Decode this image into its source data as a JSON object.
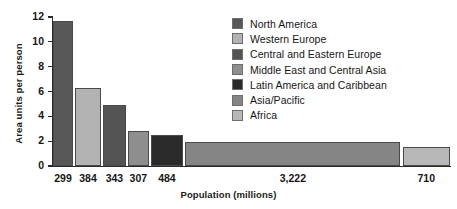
{
  "chart_data": {
    "type": "bar",
    "title": "",
    "subtitle": "",
    "xlabel": "Population (millions)",
    "ylabel": "Area units per person",
    "ylim": [
      0,
      12
    ],
    "yticks": [
      0,
      2,
      4,
      6,
      8,
      10,
      12
    ],
    "ytick_labels": [
      "0",
      "2",
      "4",
      "6",
      "8",
      "10",
      "12"
    ],
    "grid": false,
    "legend_position": "top-right",
    "variable_width": true,
    "width_meaning": "Population (millions)",
    "categories": [
      "North America",
      "Western Europe",
      "Central and Eastern Europe",
      "Middle East and Central Asia",
      "Latin America and Caribbean",
      "Asia/Pacific",
      "Africa"
    ],
    "xtick_labels": [
      "299",
      "384",
      "343",
      "307",
      "484",
      "3,222",
      "710"
    ],
    "widths": [
      299,
      384,
      343,
      307,
      484,
      3222,
      710
    ],
    "values": [
      11.7,
      6.3,
      4.9,
      2.8,
      2.5,
      1.95,
      1.55
    ],
    "colors": [
      "#585858",
      "#b3b3b3",
      "#545454",
      "#8e8e8e",
      "#2a2a2a",
      "#858585",
      "#b8b8b8"
    ],
    "series": [
      {
        "name": "Area units per person",
        "values": [
          11.7,
          6.3,
          4.9,
          2.8,
          2.5,
          1.95,
          1.55
        ]
      }
    ]
  },
  "legend": {
    "items": [
      {
        "label": "North America",
        "color": "#585858"
      },
      {
        "label": "Western Europe",
        "color": "#b3b3b3"
      },
      {
        "label": "Central and Eastern Europe",
        "color": "#545454"
      },
      {
        "label": "Middle East and Central Asia",
        "color": "#8e8e8e"
      },
      {
        "label": "Latin America and Caribbean",
        "color": "#2a2a2a"
      },
      {
        "label": "Asia/Pacific",
        "color": "#858585"
      },
      {
        "label": "Africa",
        "color": "#b8b8b8"
      }
    ]
  }
}
